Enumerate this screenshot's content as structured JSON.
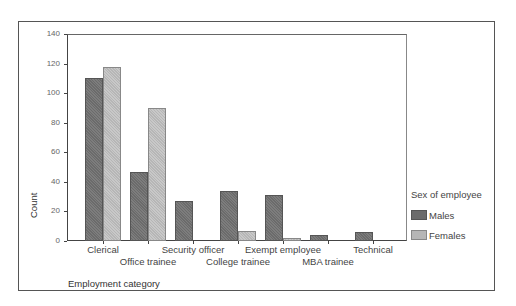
{
  "chart_data": {
    "type": "bar",
    "title": "",
    "xlabel": "Employment category",
    "ylabel": "Count",
    "ylim": [
      0,
      140
    ],
    "yticks": [
      0,
      20,
      40,
      60,
      80,
      100,
      120,
      140
    ],
    "grid": false,
    "legend_title": "Sex of employee",
    "legend_position": "right",
    "categories": [
      "Clerical",
      "Office trainee",
      "Security officer",
      "College trainee",
      "Exempt employee",
      "MBA trainee",
      "Technical"
    ],
    "series": [
      {
        "name": "Males",
        "color": "#6b6b6b",
        "values": [
          110,
          47,
          27,
          34,
          31,
          4,
          6
        ]
      },
      {
        "name": "Females",
        "color": "#b6b6b6",
        "values": [
          118,
          90,
          0,
          7,
          2,
          0,
          0
        ]
      }
    ]
  },
  "labels": {
    "yticks": [
      "0",
      "20",
      "40",
      "60",
      "80",
      "100",
      "120",
      "140"
    ],
    "ylabel": "Count",
    "xlabel": "Employment category",
    "legend_title": "Sex of employee",
    "legend_males": "Males",
    "legend_females": "Females",
    "cat0": "Clerical",
    "cat1": "Office trainee",
    "cat2": "Security officer",
    "cat3": "College trainee",
    "cat4": "Exempt employee",
    "cat5": "MBA trainee",
    "cat6": "Technical"
  }
}
